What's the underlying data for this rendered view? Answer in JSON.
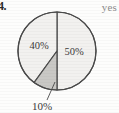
{
  "figure": {
    "item_number": "4.",
    "annotation": "yes"
  },
  "chart_data": {
    "type": "pie",
    "title": "",
    "subtitle": "",
    "xlabel": "",
    "ylabel": "",
    "legend_position": "none",
    "grid": false,
    "labels_inside": true,
    "total": 100,
    "categories": [
      "50%",
      "40%",
      "10%"
    ],
    "values": [
      50,
      40,
      10
    ],
    "slices": [
      {
        "label": "50%",
        "value": 50,
        "percent": 50,
        "color": "#f2f1ef",
        "start_angle_deg": 0,
        "end_angle_deg": 180,
        "label_placement": "inside",
        "label_x": 74,
        "label_y": 55
      },
      {
        "label": "40%",
        "value": 40,
        "percent": 40,
        "color": "#f2f1ef",
        "start_angle_deg": 216,
        "end_angle_deg": 360,
        "label_placement": "inside",
        "label_x": 39,
        "label_y": 49
      },
      {
        "label": "10%",
        "value": 10,
        "percent": 10,
        "color": "#c9c8c5",
        "start_angle_deg": 180,
        "end_angle_deg": 216,
        "label_placement": "callout",
        "label_x": 42,
        "label_y": 110
      }
    ],
    "geometry": {
      "center_x": 57,
      "center_y": 51,
      "radius": 39,
      "stroke": "#4a4a4a",
      "stroke_width": 1.2
    },
    "callout": {
      "label": "10%",
      "line_from_x": 47,
      "line_from_y": 100,
      "line_to_x": 55,
      "line_to_y": 82
    },
    "annotations": [
      "yes"
    ]
  }
}
